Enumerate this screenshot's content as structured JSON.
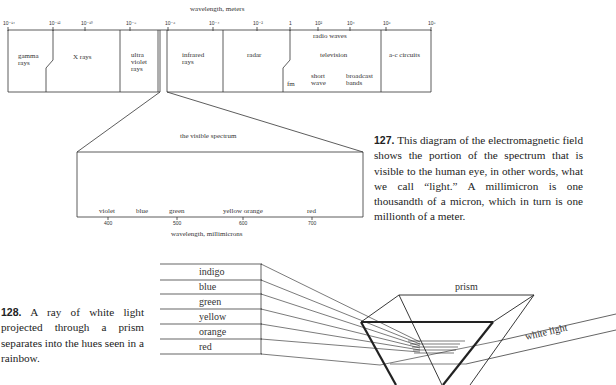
{
  "em_spectrum": {
    "axis_title": "wavelength, meters",
    "ticks": [
      {
        "label": "10⁻¹⁴",
        "x": 8
      },
      {
        "label": "10⁻¹²",
        "x": 53
      },
      {
        "label": "10⁻¹⁰",
        "x": 85
      },
      {
        "label": "10⁻⁸",
        "x": 130
      },
      {
        "label": "10⁻⁶",
        "x": 168
      },
      {
        "label": "10⁻⁴",
        "x": 213
      },
      {
        "label": "10⁻²",
        "x": 257
      },
      {
        "label": "1",
        "x": 290
      },
      {
        "label": "10²",
        "x": 318
      },
      {
        "label": "10⁴",
        "x": 350
      },
      {
        "label": "10⁶",
        "x": 386
      },
      {
        "label": "10⁸",
        "x": 431
      }
    ],
    "regions": {
      "gamma": "gamma rays",
      "xrays": "X rays",
      "ultraviolet": "ultra violet rays",
      "infrared": "infrared rays",
      "radar": "radar",
      "radio_header": "radio waves",
      "television": "television",
      "fm": "fm",
      "short_wave": "short wave",
      "broadcast": "broadcast bands",
      "ac": "a-c circuits"
    }
  },
  "visible_spectrum": {
    "title": "the visible spectrum",
    "axis_title": "wavelength, millimicrons",
    "colors": [
      "violet",
      "blue",
      "green",
      "yellow orange",
      "red"
    ],
    "ticks": [
      "400",
      "500",
      "600",
      "700"
    ]
  },
  "caption_127": {
    "number": "127.",
    "text": "This diagram of the electromagnetic field shows the portion of the spectrum that is visible to the human eye, in other words, what we call “light.” A millimicron is one thousandth of a micron, which in turn is one millionth of a meter."
  },
  "caption_128": {
    "number": "128.",
    "text": "A ray of white light projected through a prism separates into the hues seen in a rainbow."
  },
  "prism_diagram": {
    "bands": [
      "indigo",
      "blue",
      "green",
      "yellow",
      "orange",
      "red"
    ],
    "prism_label": "prism",
    "light_label": "white light"
  }
}
